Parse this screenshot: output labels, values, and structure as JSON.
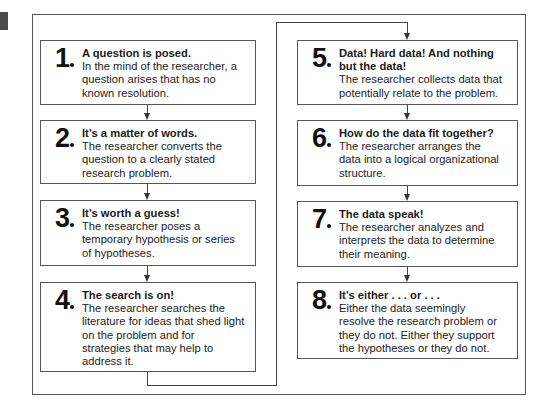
{
  "steps": [
    {
      "number": "1",
      "title": "A question is posed.",
      "lines": [
        "In the mind of the researcher, a",
        "question arises that has no",
        "known resolution."
      ]
    },
    {
      "number": "2",
      "title": "It’s a matter of words.",
      "lines": [
        "The researcher converts the",
        "question to a clearly stated",
        "research problem."
      ]
    },
    {
      "number": "3",
      "title": "It’s worth a guess!",
      "lines": [
        "The researcher poses a",
        "temporary hypothesis or series",
        "of hypotheses."
      ]
    },
    {
      "number": "4",
      "title": "The search is on!",
      "lines": [
        "The researcher searches the",
        "literature for ideas that shed light",
        "on the problem and for",
        "strategies that may help to",
        "address it."
      ]
    },
    {
      "number": "5",
      "title": "Data! Hard data! And nothing",
      "title2": "but the data!",
      "lines": [
        "The researcher collects data that",
        "potentially relate to the problem."
      ]
    },
    {
      "number": "6",
      "title": "How do the data fit together?",
      "lines": [
        "The researcher arranges the",
        "data into a logical organizational",
        "structure."
      ]
    },
    {
      "number": "7",
      "title": "The data speak!",
      "lines": [
        "The researcher analyzes and",
        "interprets the data to determine",
        "their meaning."
      ]
    },
    {
      "number": "8",
      "title": "It’s either . . . or . . .",
      "lines": [
        "Either the data seemingly",
        "resolve the research problem or",
        "they do not. Either they support",
        "the hypotheses or they do not."
      ]
    }
  ],
  "colors": {
    "border": "#555555",
    "text": "#1a1a1a",
    "tab": "#4a4a4a"
  }
}
